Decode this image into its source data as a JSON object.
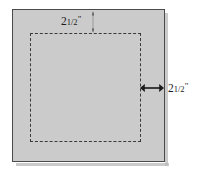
{
  "figure": {
    "type": "geometry-diagram",
    "colors": {
      "sheet_fill": "#cbcbcb",
      "sheet_border": "#4a4a4a",
      "dashed_line": "#3a3a3a",
      "label_text": "#1c1c1c",
      "background": "#ffffff"
    }
  },
  "dimensions": {
    "top": {
      "whole": "2",
      "fraction": "1/2",
      "unit": "\"",
      "full_label": "2 1/2\"",
      "orientation": "vertical",
      "measures": "distance from top edge of square to dashed line"
    },
    "right": {
      "whole": "2",
      "fraction": "1/2",
      "unit": "\"",
      "full_label": "2 1/2\"",
      "orientation": "horizontal",
      "measures": "distance from dashed line to right edge of square"
    }
  }
}
